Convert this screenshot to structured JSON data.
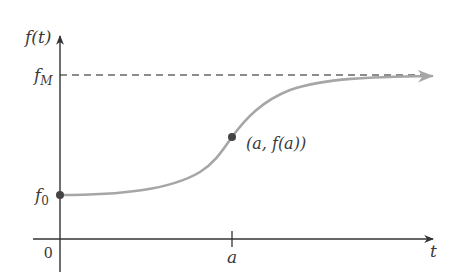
{
  "diagram": {
    "type": "logistic-curve-graph",
    "y_axis_label": "f(t)",
    "x_axis_label": "t",
    "origin_label": "0",
    "y_ticks": [
      {
        "label_main": "f",
        "label_sub": "M",
        "meaning": "upper asymptote (maximum)"
      },
      {
        "label_main": "f",
        "label_sub": "0",
        "meaning": "initial value"
      }
    ],
    "x_ticks": [
      {
        "label": "a"
      }
    ],
    "point_label": "(a, f(a))",
    "curve_color": "#a6a6a6",
    "axis_color": "#333333",
    "dashed_line_color": "#666666",
    "point_color": "#444444"
  }
}
